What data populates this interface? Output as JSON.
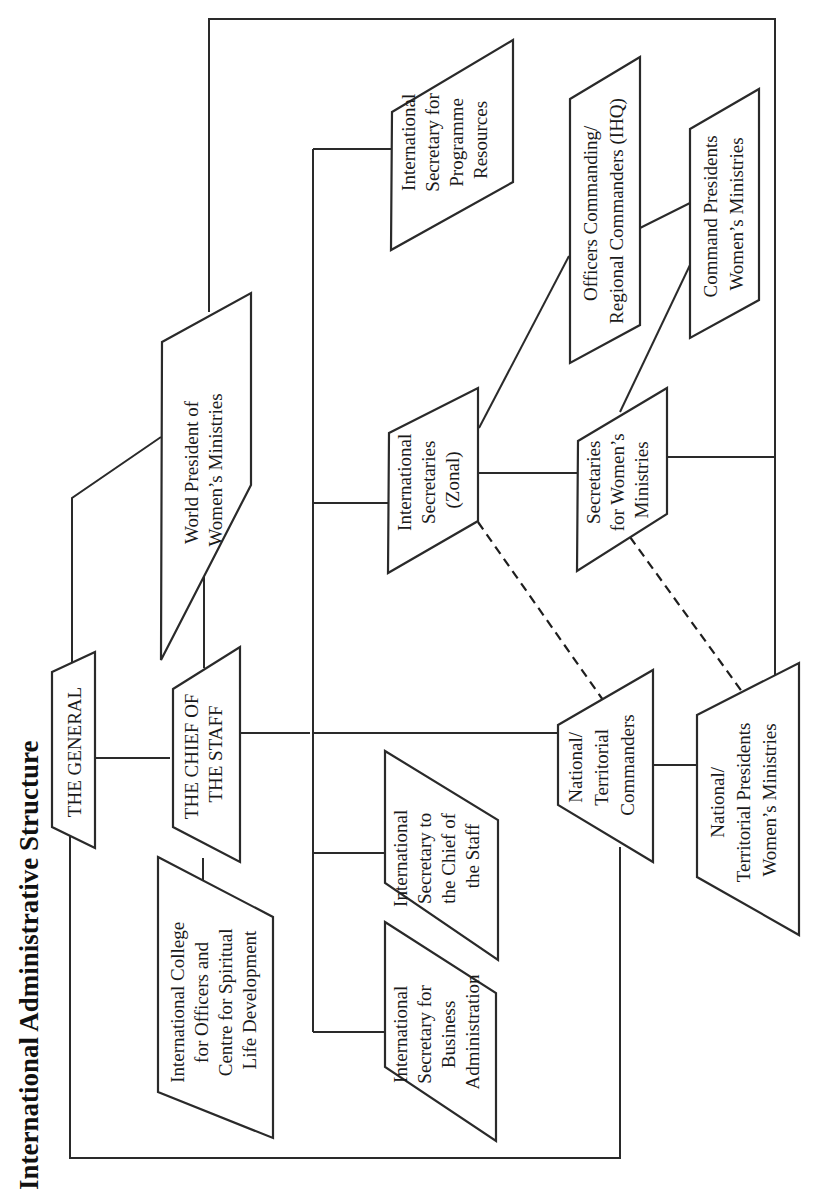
{
  "title": "International Administrative Structure",
  "colors": {
    "line": "#2a2a2a",
    "text": "#1a1a1a",
    "background": "#ffffff"
  },
  "nodes": {
    "general": {
      "lines": [
        "THE GENERAL"
      ]
    },
    "chief_of_staff": {
      "lines": [
        "THE CHIEF OF",
        "THE STAFF"
      ]
    },
    "world_president_wm": {
      "lines": [
        "World President of",
        "Women’s Ministries"
      ]
    },
    "intl_college": {
      "lines": [
        "International College",
        "for Officers and",
        "Centre for Spiritual",
        "Life Development"
      ]
    },
    "intl_sec_programme": {
      "lines": [
        "International",
        "Secretary for",
        "Programme",
        "Resources"
      ]
    },
    "intl_sec_zonal": {
      "lines": [
        "International",
        "Secretaries",
        "(Zonal)"
      ]
    },
    "intl_sec_chief": {
      "lines": [
        "International",
        "Secretary to",
        "the Chief of",
        "the Staff"
      ]
    },
    "intl_sec_business": {
      "lines": [
        "International",
        "Secretary for",
        "Business",
        "Administration"
      ]
    },
    "officers_commanding": {
      "lines": [
        "Officers Commanding/",
        "Regional Commanders (IHQ)"
      ]
    },
    "command_presidents_wm": {
      "lines": [
        "Command Presidents",
        "Women’s Ministries"
      ]
    },
    "secretaries_wm": {
      "lines": [
        "Secretaries",
        "for Women’s",
        "Ministries"
      ]
    },
    "national_commanders": {
      "lines": [
        "National/",
        "Territorial",
        "Commanders"
      ]
    },
    "national_presidents_wm": {
      "lines": [
        "National/",
        "Territorial Presidents",
        "Women’s Ministries"
      ]
    }
  },
  "connections": [
    {
      "from": "general",
      "to": "chief_of_staff",
      "style": "solid"
    },
    {
      "from": "general",
      "to": "world_president_wm",
      "style": "solid"
    },
    {
      "from": "chief_of_staff",
      "to": "world_president_wm",
      "style": "solid"
    },
    {
      "from": "chief_of_staff",
      "to": "intl_college",
      "style": "solid"
    },
    {
      "from": "chief_of_staff",
      "to": "intl_sec_programme",
      "style": "solid"
    },
    {
      "from": "chief_of_staff",
      "to": "intl_sec_zonal",
      "style": "solid"
    },
    {
      "from": "chief_of_staff",
      "to": "intl_sec_chief",
      "style": "solid"
    },
    {
      "from": "chief_of_staff",
      "to": "intl_sec_business",
      "style": "solid"
    },
    {
      "from": "chief_of_staff",
      "to": "national_commanders",
      "style": "solid"
    },
    {
      "from": "intl_sec_zonal",
      "to": "officers_commanding",
      "style": "solid"
    },
    {
      "from": "intl_sec_zonal",
      "to": "secretaries_wm",
      "style": "solid"
    },
    {
      "from": "officers_commanding",
      "to": "command_presidents_wm",
      "style": "solid"
    },
    {
      "from": "secretaries_wm",
      "to": "command_presidents_wm",
      "style": "solid"
    },
    {
      "from": "national_commanders",
      "to": "national_presidents_wm",
      "style": "solid"
    },
    {
      "from": "world_president_wm",
      "to": "national_presidents_wm",
      "style": "solid"
    },
    {
      "from": "secretaries_wm",
      "to": "national_presidents_wm",
      "style": "solid"
    },
    {
      "from": "general",
      "to": "national_commanders",
      "style": "solid"
    },
    {
      "from": "intl_sec_zonal",
      "to": "national_commanders",
      "style": "dashed"
    },
    {
      "from": "secretaries_wm",
      "to": "national_presidents_wm",
      "style": "dashed"
    }
  ]
}
